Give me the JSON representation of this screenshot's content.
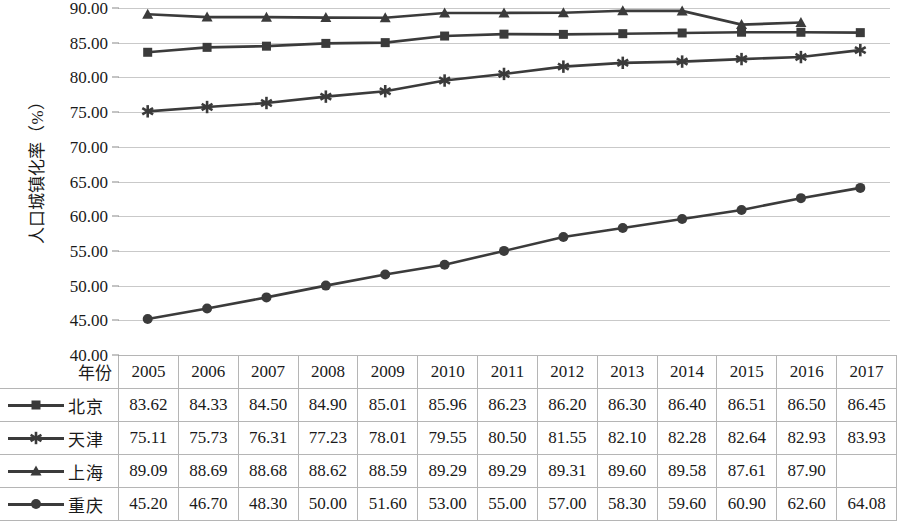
{
  "chart_data": {
    "type": "line",
    "title": "",
    "xlabel": "年份",
    "ylabel": "人口城镇化率（%）",
    "ylim": [
      40.0,
      90.0
    ],
    "ytick_step": 5,
    "ytick_labels": [
      "90.00",
      "85.00",
      "80.00",
      "75.00",
      "70.00",
      "65.00",
      "60.00",
      "55.00",
      "50.00",
      "45.00",
      "40.00"
    ],
    "ytick_values": [
      90.0,
      85.0,
      80.0,
      75.0,
      70.0,
      65.0,
      60.0,
      55.0,
      50.0,
      45.0,
      40.0
    ],
    "grid": true,
    "legend_position": "table-left-column",
    "categories": [
      "2005",
      "2006",
      "2007",
      "2008",
      "2009",
      "2010",
      "2011",
      "2012",
      "2013",
      "2014",
      "2015",
      "2016",
      "2017"
    ],
    "series": [
      {
        "name": "北京",
        "marker": "square",
        "color": "#3b3b3b",
        "values": [
          83.62,
          84.33,
          84.5,
          84.9,
          85.01,
          85.96,
          86.23,
          86.2,
          86.3,
          86.4,
          86.51,
          86.5,
          86.45
        ],
        "labels": [
          "83.62",
          "84.33",
          "84.50",
          "84.90",
          "85.01",
          "85.96",
          "86.23",
          "86.20",
          "86.30",
          "86.40",
          "86.51",
          "86.50",
          "86.45"
        ]
      },
      {
        "name": "天津",
        "marker": "asterisk",
        "color": "#3b3b3b",
        "values": [
          75.11,
          75.73,
          76.31,
          77.23,
          78.01,
          79.55,
          80.5,
          81.55,
          82.1,
          82.28,
          82.64,
          82.93,
          83.93
        ],
        "labels": [
          "75.11",
          "75.73",
          "76.31",
          "77.23",
          "78.01",
          "79.55",
          "80.50",
          "81.55",
          "82.10",
          "82.28",
          "82.64",
          "82.93",
          "83.93"
        ]
      },
      {
        "name": "上海",
        "marker": "triangle",
        "color": "#3b3b3b",
        "values": [
          89.09,
          88.69,
          88.68,
          88.62,
          88.59,
          89.29,
          89.29,
          89.31,
          89.6,
          89.58,
          87.61,
          87.9,
          null
        ],
        "labels": [
          "89.09",
          "88.69",
          "88.68",
          "88.62",
          "88.59",
          "89.29",
          "89.29",
          "89.31",
          "89.60",
          "89.58",
          "87.61",
          "87.90",
          ""
        ]
      },
      {
        "name": "重庆",
        "marker": "circle",
        "color": "#3b3b3b",
        "values": [
          45.2,
          46.7,
          48.3,
          50.0,
          51.6,
          53.0,
          55.0,
          57.0,
          58.3,
          59.6,
          60.9,
          62.6,
          64.08
        ],
        "labels": [
          "45.20",
          "46.70",
          "48.30",
          "50.00",
          "51.60",
          "53.00",
          "55.00",
          "57.00",
          "58.30",
          "59.60",
          "60.90",
          "62.60",
          "64.08"
        ]
      }
    ]
  }
}
